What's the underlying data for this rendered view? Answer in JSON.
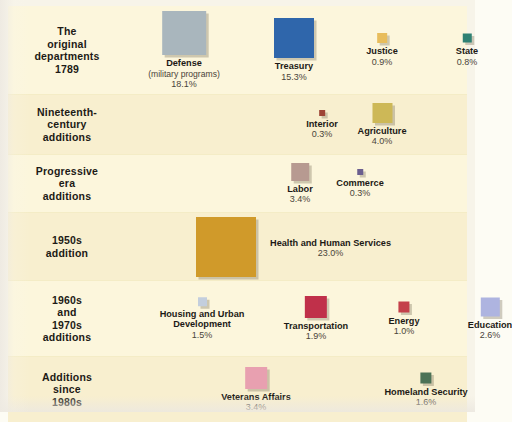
{
  "chart_data": {
    "type": "bar",
    "xlabel": "",
    "ylabel": "Share of federal spending",
    "legend": "none",
    "grid": false,
    "note": "Square area is proportional to each department's percentage of federal outlays.",
    "categories": [
      "Defense (military programs)",
      "Treasury",
      "Justice",
      "State",
      "Interior",
      "Agriculture",
      "Labor",
      "Commerce",
      "Health and Human Services",
      "Housing and Urban Development",
      "Transportation",
      "Energy",
      "Education",
      "Veterans Affairs",
      "Homeland Security"
    ],
    "values": [
      18.1,
      15.3,
      0.9,
      0.8,
      0.3,
      4.0,
      3.4,
      0.3,
      23.0,
      1.5,
      1.9,
      1.0,
      2.6,
      3.4,
      1.6
    ],
    "ylim": [
      0,
      23.0
    ],
    "groups": [
      {
        "group": "The original departments 1789",
        "departments": [
          "Defense (military programs)",
          "Treasury",
          "Justice",
          "State"
        ],
        "values": [
          18.1,
          15.3,
          0.9,
          0.8
        ]
      },
      {
        "group": "Nineteenth-century additions",
        "departments": [
          "Interior",
          "Agriculture"
        ],
        "values": [
          0.3,
          4.0
        ]
      },
      {
        "group": "Progressive era additions",
        "departments": [
          "Labor",
          "Commerce"
        ],
        "values": [
          3.4,
          0.3
        ]
      },
      {
        "group": "1950s addition",
        "departments": [
          "Health and Human Services"
        ],
        "values": [
          23.0
        ]
      },
      {
        "group": "1960s and 1970s additions",
        "departments": [
          "Housing and Urban Development",
          "Transportation",
          "Energy",
          "Education"
        ],
        "values": [
          1.5,
          1.9,
          1.0,
          2.6
        ]
      },
      {
        "group": "Additions since 1980s",
        "departments": [
          "Veterans Affairs",
          "Homeland Security"
        ],
        "values": [
          3.4,
          1.6
        ]
      }
    ]
  },
  "palette": {
    "panel_background": "#fbf4d7",
    "band_alt_background": "#f8efcf",
    "page_background": "#f7f4e9",
    "divider": "#f4ecc6",
    "label_text": "#1d1a16",
    "value_text": "#4a443a"
  },
  "rows": [
    {
      "label_lines": [
        "The",
        "original",
        "departments",
        "1789"
      ],
      "items": [
        {
          "name": "Defense",
          "sub": "(military programs)",
          "pct": "18.1%",
          "color": "#a9b6bd"
        },
        {
          "name": "Treasury",
          "sub": "",
          "pct": "15.3%",
          "color": "#2f66ab"
        },
        {
          "name": "Justice",
          "sub": "",
          "pct": "0.9%",
          "color": "#e8bd5c"
        },
        {
          "name": "State",
          "sub": "",
          "pct": "0.8%",
          "color": "#2f8173"
        }
      ]
    },
    {
      "label_lines": [
        "Nineteenth-",
        "century",
        "additions"
      ],
      "items": [
        {
          "name": "Interior",
          "sub": "",
          "pct": "0.3%",
          "color": "#9e4436"
        },
        {
          "name": "Agriculture",
          "sub": "",
          "pct": "4.0%",
          "color": "#cdb857"
        }
      ]
    },
    {
      "label_lines": [
        "Progressive",
        "era",
        "additions"
      ],
      "items": [
        {
          "name": "Labor",
          "sub": "",
          "pct": "3.4%",
          "color": "#b79a91"
        },
        {
          "name": "Commerce",
          "sub": "",
          "pct": "0.3%",
          "color": "#6b5f8f"
        }
      ]
    },
    {
      "label_lines": [
        "1950s",
        "addition"
      ],
      "items": [
        {
          "name": "Health and Human Services",
          "sub": "",
          "pct": "23.0%",
          "color": "#d09a2a"
        }
      ]
    },
    {
      "label_lines": [
        "1960s",
        "and",
        "1970s",
        "additions"
      ],
      "items": [
        {
          "name": "Housing and Urban Development",
          "sub": "",
          "pct": "1.5%",
          "color": "#c3cedd"
        },
        {
          "name": "Transportation",
          "sub": "",
          "pct": "1.9%",
          "color": "#c0304a"
        },
        {
          "name": "Energy",
          "sub": "",
          "pct": "1.0%",
          "color": "#c4404a"
        },
        {
          "name": "Education",
          "sub": "",
          "pct": "2.6%",
          "color": "#aeb4e0"
        }
      ]
    },
    {
      "label_lines": [
        "Additions",
        "since",
        "1980s"
      ],
      "items": [
        {
          "name": "Veterans Affairs",
          "sub": "",
          "pct": "3.4%",
          "color": "#e8a0b0"
        },
        {
          "name": "Homeland Security",
          "sub": "",
          "pct": "1.6%",
          "color": "#4c7256"
        }
      ]
    }
  ]
}
